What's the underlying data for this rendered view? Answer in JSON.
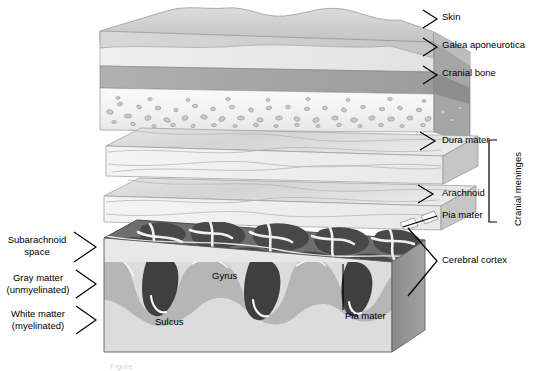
{
  "figure": {
    "type": "anatomical-exploded-diagram",
    "caption_fragment": "Figure"
  },
  "labels_right": [
    {
      "id": "skin",
      "text": "Skin",
      "x": 442,
      "y": 16
    },
    {
      "id": "galea",
      "text": "Galea aponeurotica",
      "x": 442,
      "y": 44
    },
    {
      "id": "cranial-bone",
      "text": "Cranial bone",
      "x": 442,
      "y": 71
    },
    {
      "id": "dura-mater",
      "text": "Dura mater",
      "x": 442,
      "y": 138
    },
    {
      "id": "arachnoid",
      "text": "Arachnoid",
      "x": 442,
      "y": 190
    },
    {
      "id": "pia-mater-r",
      "text": "Pia mater",
      "x": 442,
      "y": 212
    },
    {
      "id": "cerebral-cortex",
      "text": "Cerebral cortex",
      "x": 442,
      "y": 257
    }
  ],
  "bracket_right": {
    "id": "cranial-meninges",
    "text": "Cranial meninges"
  },
  "labels_left": [
    {
      "id": "subarachnoid-space",
      "line1": "Subarachnoid",
      "line2": "space",
      "y": 234
    },
    {
      "id": "gray-matter",
      "line1": "Gray matter",
      "line2": "(unmyelinated)",
      "y": 272
    },
    {
      "id": "white-matter",
      "line1": "White matter",
      "line2": "(myelinated)",
      "y": 308
    }
  ],
  "labels_inner": [
    {
      "id": "gyrus",
      "text": "Gyrus",
      "x": 212,
      "y": 276
    },
    {
      "id": "sulcus",
      "text": "Sulcus",
      "x": 155,
      "y": 322
    },
    {
      "id": "pia-mater-inner",
      "text": "Pia mater",
      "x": 345,
      "y": 316
    }
  ],
  "colors": {
    "skin_top": "#d2d2d2",
    "skin_front": "#c9c9c9",
    "skin_side": "#9e9e9e",
    "subcutaneous": "#ebebeb",
    "galea": "#a9a9a9",
    "galea_side": "#8d8d8d",
    "bone": "#f4f4f4",
    "bone_side": "#d6d6d6",
    "diploe_speckle": "#9b9b9b",
    "dura_top": "#dcdcdc",
    "dura_front": "#f0f0f0",
    "dura_side": "#c2c2c2",
    "arachnoid_top": "#dedede",
    "arachnoid_front": "#f1f1f1",
    "arachnoid_side": "#c4c4c4",
    "subarachnoid_bg": "#6e6e6e",
    "gyri_dark": "#4a4a4a",
    "trabeculae": "#f2f2f2",
    "gray_matter": "#b4b4b4",
    "white_matter": "#dcdcdc",
    "sulcus_dark": "#3d3d3d",
    "brain_side": "#8e8e8e",
    "brain_front_base": "#cfcfcf",
    "outline": "#4a4a4a",
    "leader": "#000000"
  }
}
